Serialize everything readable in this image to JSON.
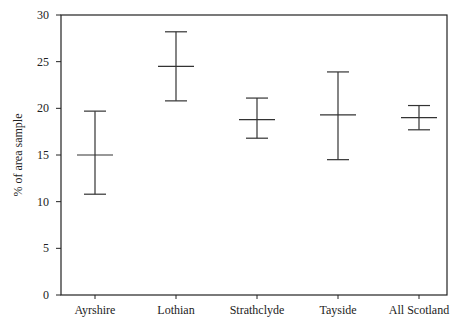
{
  "chart_data": {
    "type": "errorbar",
    "title": "",
    "xlabel": "",
    "ylabel": "% of area sample",
    "ylim": [
      0,
      30
    ],
    "yticks": [
      0,
      5,
      10,
      15,
      20,
      25,
      30
    ],
    "grid": false,
    "legend": null,
    "categories": [
      "Ayrshire",
      "Lothian",
      "Strathclyde",
      "Tayside",
      "All Scotland"
    ],
    "series": [
      {
        "name": "% of area sample",
        "mean": [
          15.0,
          24.5,
          18.8,
          19.3,
          19.0
        ],
        "lower": [
          10.8,
          20.8,
          16.8,
          14.5,
          17.7
        ],
        "upper": [
          19.7,
          28.2,
          21.1,
          23.9,
          20.3
        ]
      }
    ]
  },
  "colors": {
    "line": "#333333",
    "axis": "#222222"
  }
}
